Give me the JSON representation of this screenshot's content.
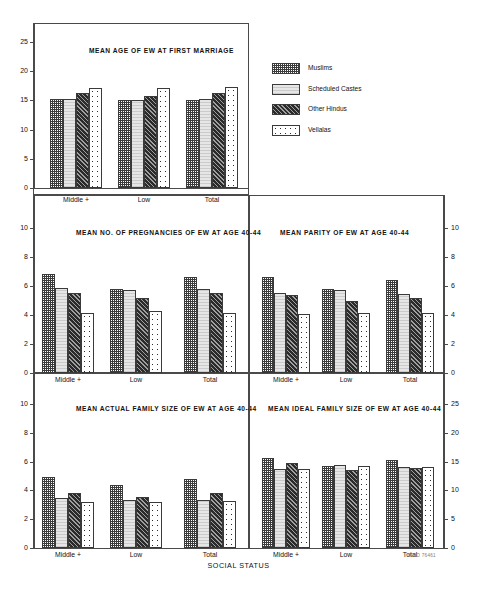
{
  "figure": {
    "xaxis_title": "SOCIAL STATUS",
    "credit": "WHO 76461"
  },
  "legend": {
    "items": [
      {
        "label": "Muslims",
        "pattern": "checker-dark",
        "key": "muslims"
      },
      {
        "label": "Scheduled Castes",
        "pattern": "light-gray-solid",
        "key": "scheduled"
      },
      {
        "label": "Other Hindus",
        "pattern": "dark-diagonal-hatch",
        "key": "hindus"
      },
      {
        "label": "Vellalas",
        "pattern": "white-sparse-dots",
        "key": "vellalas"
      }
    ]
  },
  "chart_data": [
    {
      "type": "bar",
      "id": "mean-age-first-marriage",
      "title": "MEAN AGE OF EW AT FIRST MARRIAGE",
      "xlabel": "SOCIAL STATUS",
      "ylabel": "",
      "ylim": [
        0,
        25
      ],
      "yticks": [
        0,
        5,
        10,
        15,
        20,
        25
      ],
      "grid": false,
      "legend_position": "outside-right-top",
      "categories": [
        "Middle +",
        "Low",
        "Total"
      ],
      "series": [
        {
          "name": "Muslims",
          "values": [
            15.3,
            15.0,
            15.1
          ]
        },
        {
          "name": "Scheduled Castes",
          "values": [
            15.3,
            15.0,
            15.2
          ]
        },
        {
          "name": "Other Hindus",
          "values": [
            16.3,
            15.8,
            16.2
          ]
        },
        {
          "name": "Vellalas",
          "values": [
            17.2,
            17.1,
            17.3
          ]
        }
      ]
    },
    {
      "type": "bar",
      "id": "mean-no-pregnancies",
      "title": "MEAN NO. OF PREGNANCIES OF EW AT AGE 40-44",
      "xlabel": "SOCIAL STATUS",
      "ylabel": "",
      "ylim": [
        0,
        10
      ],
      "yticks": [
        0,
        2,
        4,
        6,
        8,
        10
      ],
      "grid": false,
      "legend_position": "none",
      "categories": [
        "Middle +",
        "Low",
        "Total"
      ],
      "series": [
        {
          "name": "Muslims",
          "values": [
            6.8,
            5.8,
            6.6
          ]
        },
        {
          "name": "Scheduled Castes",
          "values": [
            5.85,
            5.75,
            5.8
          ]
        },
        {
          "name": "Other Hindus",
          "values": [
            5.55,
            5.15,
            5.5
          ]
        },
        {
          "name": "Vellalas",
          "values": [
            4.15,
            4.3,
            4.15
          ]
        }
      ]
    },
    {
      "type": "bar",
      "id": "mean-parity",
      "title": "MEAN PARITY OF EW AT AGE 40-44",
      "xlabel": "SOCIAL STATUS",
      "ylabel": "",
      "ylim": [
        0,
        10
      ],
      "yticks": [
        0,
        2,
        4,
        6,
        8,
        10
      ],
      "grid": false,
      "legend_position": "none",
      "categories": [
        "Middle +",
        "Low",
        "Total"
      ],
      "series": [
        {
          "name": "Muslims",
          "values": [
            6.6,
            5.8,
            6.4
          ]
        },
        {
          "name": "Scheduled Castes",
          "values": [
            5.5,
            5.7,
            5.45
          ]
        },
        {
          "name": "Other Hindus",
          "values": [
            5.35,
            5.0,
            5.2
          ]
        },
        {
          "name": "Vellalas",
          "values": [
            4.1,
            4.15,
            4.15
          ]
        }
      ]
    },
    {
      "type": "bar",
      "id": "mean-actual-family-size",
      "title": "MEAN ACTUAL FAMILY SIZE OF EW AT AGE 40-44",
      "xlabel": "SOCIAL STATUS",
      "ylabel": "",
      "ylim": [
        0,
        10
      ],
      "yticks": [
        0,
        2,
        4,
        6,
        8,
        10
      ],
      "grid": false,
      "legend_position": "none",
      "categories": [
        "Middle +",
        "Low",
        "Total"
      ],
      "series": [
        {
          "name": "Muslims",
          "values": [
            4.95,
            4.35,
            4.8
          ]
        },
        {
          "name": "Scheduled Castes",
          "values": [
            3.45,
            3.3,
            3.3
          ]
        },
        {
          "name": "Other Hindus",
          "values": [
            3.85,
            3.55,
            3.8
          ]
        },
        {
          "name": "Vellalas",
          "values": [
            3.2,
            3.2,
            3.25
          ]
        }
      ]
    },
    {
      "type": "bar",
      "id": "mean-ideal-family-size",
      "title": "MEAN IDEAL FAMILY SIZE OF EW AT AGE 40-44",
      "xlabel": "SOCIAL STATUS",
      "ylabel": "",
      "ylim": [
        0,
        25
      ],
      "yticks": [
        0,
        5,
        10,
        15,
        20,
        25
      ],
      "grid": false,
      "legend_position": "none",
      "categories": [
        "Middle +",
        "Low",
        "Total"
      ],
      "series": [
        {
          "name": "Muslims",
          "values": [
            15.6,
            14.3,
            15.2
          ]
        },
        {
          "name": "Scheduled Castes",
          "values": [
            13.7,
            14.4,
            14.1
          ]
        },
        {
          "name": "Other Hindus",
          "values": [
            14.7,
            13.5,
            13.9
          ]
        },
        {
          "name": "Vellalas",
          "values": [
            13.7,
            14.2,
            14.1
          ]
        }
      ]
    }
  ]
}
